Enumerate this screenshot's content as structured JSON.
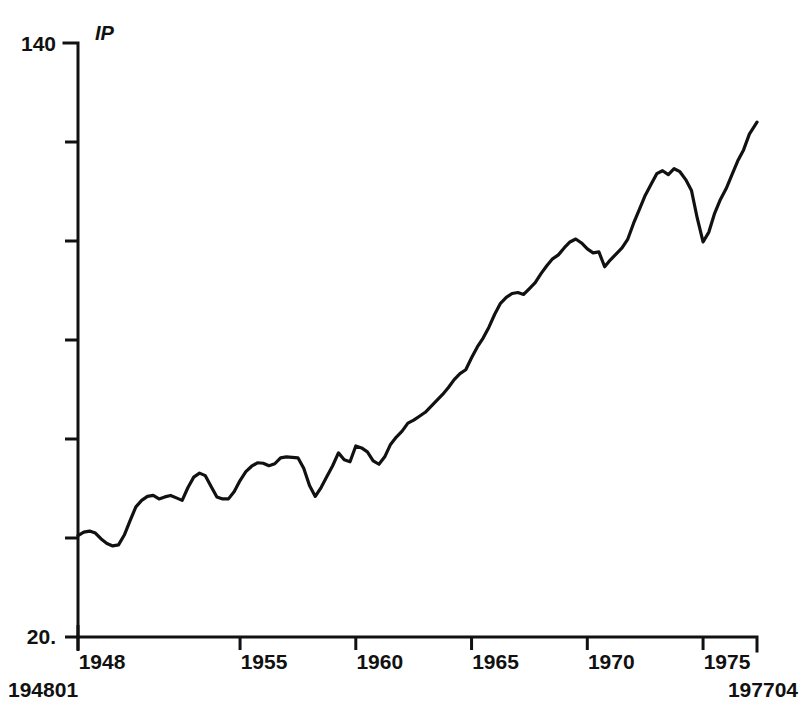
{
  "figure": {
    "series_name": "IP",
    "start_label": "194801",
    "end_label": "197704",
    "line_color": "#111111",
    "background_color": "#ffffff"
  },
  "chart_data": {
    "type": "line",
    "title": "IP",
    "xlabel": "",
    "ylabel": "",
    "grid": false,
    "legend": "none",
    "ylim": [
      20,
      140
    ],
    "xlim": [
      1948.0,
      1977.33
    ],
    "ytick_labels": [
      "140",
      "20."
    ],
    "ytick_values": [
      140,
      20
    ],
    "ytick_minor_count": 5,
    "xtick_labels": [
      "1948",
      "1955",
      "1960",
      "1965",
      "1970",
      "1975"
    ],
    "xtick_values": [
      1948,
      1955,
      1960,
      1965,
      1970,
      1975
    ],
    "x_range_start_label": "194801",
    "x_range_end_label": "197704",
    "series": [
      {
        "name": "IP",
        "x": [
          1948.0,
          1948.25,
          1948.5,
          1948.75,
          1949.0,
          1949.25,
          1949.5,
          1949.75,
          1950.0,
          1950.25,
          1950.5,
          1950.75,
          1951.0,
          1951.25,
          1951.5,
          1951.75,
          1952.0,
          1952.25,
          1952.5,
          1952.75,
          1953.0,
          1953.25,
          1953.5,
          1953.75,
          1954.0,
          1954.25,
          1954.5,
          1954.75,
          1955.0,
          1955.25,
          1955.5,
          1955.75,
          1956.0,
          1956.25,
          1956.5,
          1956.75,
          1957.0,
          1957.25,
          1957.5,
          1957.75,
          1958.0,
          1958.25,
          1958.5,
          1958.75,
          1959.0,
          1959.25,
          1959.5,
          1959.75,
          1960.0,
          1960.25,
          1960.5,
          1960.75,
          1961.0,
          1961.25,
          1961.5,
          1961.75,
          1962.0,
          1962.25,
          1962.5,
          1962.75,
          1963.0,
          1963.25,
          1963.5,
          1963.75,
          1964.0,
          1964.25,
          1964.5,
          1964.75,
          1965.0,
          1965.25,
          1965.5,
          1965.75,
          1966.0,
          1966.25,
          1966.5,
          1966.75,
          1967.0,
          1967.25,
          1967.5,
          1967.75,
          1968.0,
          1968.25,
          1968.5,
          1968.75,
          1969.0,
          1969.25,
          1969.5,
          1969.75,
          1970.0,
          1970.25,
          1970.5,
          1970.75,
          1971.0,
          1971.25,
          1971.5,
          1971.75,
          1972.0,
          1972.25,
          1972.5,
          1972.75,
          1973.0,
          1973.25,
          1973.5,
          1973.75,
          1974.0,
          1974.25,
          1974.5,
          1974.75,
          1975.0,
          1975.25,
          1975.5,
          1975.75,
          1976.0,
          1976.25,
          1976.5,
          1976.75,
          1977.0,
          1977.33
        ],
        "values": [
          40.5,
          41.2,
          41.4,
          41.0,
          39.8,
          38.9,
          38.4,
          38.6,
          40.6,
          43.5,
          46.3,
          47.6,
          48.4,
          48.6,
          47.9,
          48.3,
          48.6,
          48.1,
          47.6,
          50.2,
          52.3,
          53.1,
          52.6,
          50.4,
          48.3,
          47.9,
          47.9,
          49.4,
          51.6,
          53.4,
          54.5,
          55.2,
          55.1,
          54.6,
          55.0,
          56.2,
          56.4,
          56.3,
          56.2,
          54.1,
          50.6,
          48.4,
          50.2,
          52.4,
          54.6,
          57.2,
          55.8,
          55.4,
          58.6,
          58.2,
          57.4,
          55.6,
          54.9,
          56.4,
          58.9,
          60.4,
          61.6,
          63.2,
          63.8,
          64.6,
          65.4,
          66.6,
          67.8,
          69.0,
          70.4,
          72.0,
          73.2,
          74.0,
          76.4,
          78.6,
          80.4,
          82.6,
          85.2,
          87.4,
          88.6,
          89.4,
          89.6,
          89.2,
          90.4,
          91.6,
          93.4,
          95.0,
          96.4,
          97.2,
          98.6,
          99.8,
          100.4,
          99.6,
          98.4,
          97.6,
          97.8,
          94.8,
          96.2,
          97.4,
          98.6,
          100.4,
          103.6,
          106.4,
          109.2,
          111.4,
          113.6,
          114.2,
          113.4,
          114.6,
          114.0,
          112.4,
          110.2,
          104.6,
          99.8,
          101.8,
          105.6,
          108.4,
          110.6,
          113.4,
          116.2,
          118.4,
          121.6,
          124.0
        ]
      }
    ],
    "annotations": [
      {
        "label": "194801",
        "position": "bottom-left"
      },
      {
        "label": "197704",
        "position": "bottom-right"
      },
      {
        "label": "IP",
        "position": "top-left"
      }
    ]
  }
}
